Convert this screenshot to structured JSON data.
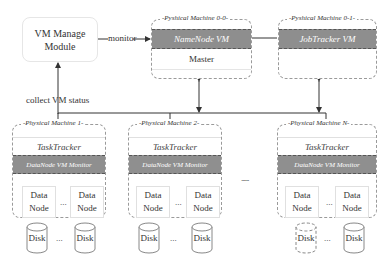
{
  "diagram": {
    "vm_manage_module": {
      "line1": "VM Manage",
      "line2": "Module"
    },
    "monitor_label": "monitor",
    "collect_label": "collect VM status",
    "master_machine": {
      "title": "-Pyshical Machine 0-0-",
      "vm_label": "NameNode VM",
      "role_label": "Master"
    },
    "jobtracker_machine": {
      "title": "-Pyshical Machine 0-1-",
      "vm_label": "JobTracker VM"
    },
    "physical_machines": [
      {
        "title": "-Physical Machine 1-",
        "tasktracker": "TaskTracker",
        "monitor": "DataNode VM Monitor",
        "datanode1": {
          "l1": "Data",
          "l2": "Node"
        },
        "datanode2": {
          "l1": "Data",
          "l2": "Node"
        },
        "ellipsis": "...",
        "disk1": "Disk",
        "disk2": "Disk"
      },
      {
        "title": "-Physical Machine 2-",
        "tasktracker": "TaskTracker",
        "monitor": "DataNode VM Monitor",
        "datanode1": {
          "l1": "Data",
          "l2": "Node"
        },
        "datanode2": {
          "l1": "Data",
          "l2": "Node"
        },
        "ellipsis": "...",
        "disk1": "Disk",
        "disk2": "Disk"
      },
      {
        "title": "-Physical Machine N-",
        "tasktracker": "TaskTracker",
        "monitor": "DataNode VM Monitor",
        "datanode1": {
          "l1": "Data",
          "l2": "Node"
        },
        "datanode2": {
          "l1": "Data",
          "l2": "Node"
        },
        "ellipsis": "...",
        "disk1": "Disk",
        "disk2": "Disk"
      }
    ],
    "between_machines_ellipsis": "......"
  }
}
